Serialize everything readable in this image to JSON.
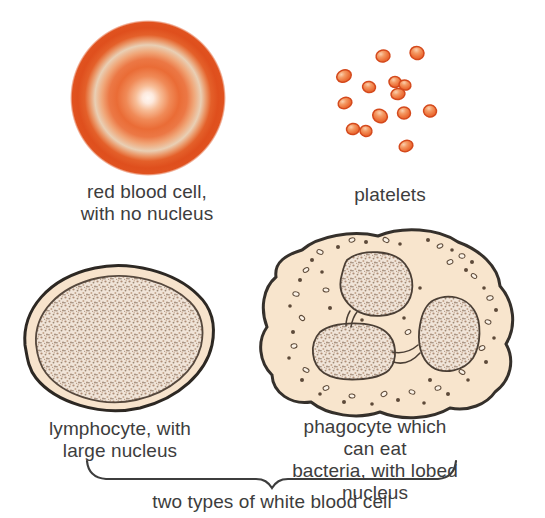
{
  "labels": {
    "red_blood_cell": "red blood cell,\nwith no nucleus",
    "platelets": "platelets",
    "lymphocyte": "lymphocyte, with\nlarge nucleus",
    "phagocyte": "phagocyte which can eat\nbacteria, with lobed nucleus",
    "caption": "two types of white blood cell"
  },
  "colors": {
    "text": "#3d3d3d",
    "rbc_rim": "#df4f1d",
    "rbc_center": "#fff7f1",
    "platelet_fill": "#ed7038",
    "platelet_outline": "#d4491c",
    "cell_cytoplasm": "#f7e3cc",
    "cell_outline": "#35302b",
    "nucleus_base": "#f0e4d8",
    "nucleus_dot": "#b08f78",
    "granule": "#5d4a39",
    "background": "#ffffff"
  }
}
